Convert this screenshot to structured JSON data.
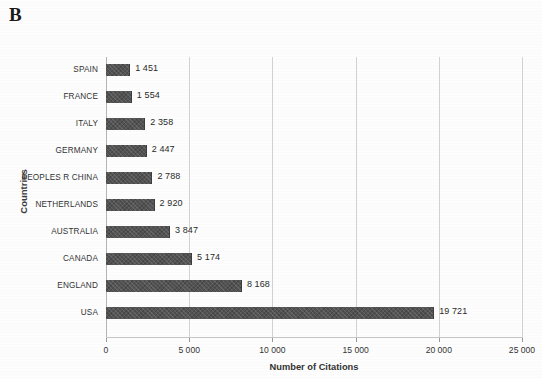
{
  "panel": {
    "letter": "B"
  },
  "chart_data": {
    "type": "bar",
    "orientation": "horizontal",
    "title": "",
    "xlabel": "Number of Citations",
    "ylabel": "Countries",
    "categories": [
      "SPAIN",
      "FRANCE",
      "ITALY",
      "GERMANY",
      "PEOPLES R CHINA",
      "NETHERLANDS",
      "AUSTRALIA",
      "CANADA",
      "ENGLAND",
      "USA"
    ],
    "values": [
      1451,
      1554,
      2358,
      2447,
      2788,
      2920,
      3847,
      5174,
      8168,
      19721
    ],
    "value_labels": [
      "1 451",
      "1 554",
      "2 358",
      "2 447",
      "2 788",
      "2 920",
      "3 847",
      "5 174",
      "8 168",
      "19 721"
    ],
    "xlim": [
      0,
      25000
    ],
    "xticks": [
      0,
      5000,
      10000,
      15000,
      20000,
      25000
    ],
    "xtick_labels": [
      "0",
      "5 000",
      "10 000",
      "15 000",
      "20 000",
      "25 000"
    ],
    "grid": "vertical",
    "legend": null,
    "bar_color": "#535353"
  }
}
